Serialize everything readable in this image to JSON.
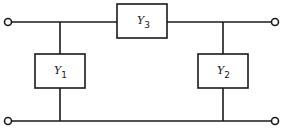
{
  "diagram": {
    "type": "pi-network",
    "elements": {
      "y3": {
        "symbol": "Y",
        "subscript": "3",
        "position": "series-top"
      },
      "y1": {
        "symbol": "Y",
        "subscript": "1",
        "position": "shunt-left"
      },
      "y2": {
        "symbol": "Y",
        "subscript": "2",
        "position": "shunt-right"
      }
    },
    "terminals": [
      "input-top",
      "input-bottom",
      "output-top",
      "output-bottom"
    ],
    "colors": {
      "line": "#1a1a1a",
      "background": "#ffffff"
    }
  }
}
